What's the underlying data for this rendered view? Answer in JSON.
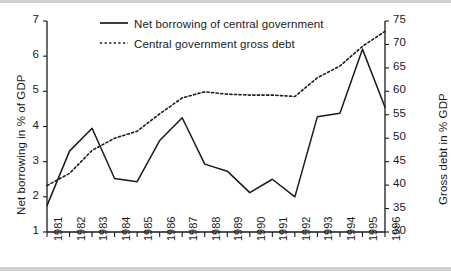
{
  "chart_data": {
    "type": "line",
    "title": "",
    "xlabel": "",
    "ylabel": "Net borrowing in % of GDP",
    "y2label": "Gross debt in % GDP",
    "grid": false,
    "legend_position": "top-center",
    "x": [
      1981,
      1982,
      1983,
      1984,
      1985,
      1986,
      1987,
      1988,
      1989,
      1990,
      1991,
      1992,
      1993,
      1994,
      1995,
      1996
    ],
    "categories": [
      "1981",
      "1982",
      "1983",
      "1984",
      "1985",
      "1986",
      "1987",
      "1988",
      "1989",
      "1990",
      "1991",
      "1992",
      "1993",
      "1994",
      "1995",
      "1996"
    ],
    "ylim": [
      1,
      7
    ],
    "yticks": [
      1,
      2,
      3,
      4,
      5,
      6,
      7
    ],
    "y2lim": [
      30,
      75
    ],
    "y2ticks": [
      30,
      35,
      40,
      45,
      50,
      55,
      60,
      65,
      70,
      75
    ],
    "series": [
      {
        "name": "Net borrowing of central government",
        "axis": "left",
        "style": "solid",
        "color": "#1a1a1a",
        "values": [
          1.75,
          3.3,
          3.95,
          2.52,
          2.43,
          3.6,
          4.25,
          2.93,
          2.73,
          2.12,
          2.5,
          2.0,
          4.28,
          4.38,
          6.2,
          4.55
        ]
      },
      {
        "name": "Central government gross debt",
        "axis": "right",
        "style": "dotted",
        "color": "#1a1a1a",
        "values": [
          39.9,
          42.5,
          47.4,
          50.0,
          51.5,
          55.2,
          58.6,
          59.9,
          59.4,
          59.2,
          59.2,
          58.9,
          62.9,
          65.4,
          69.6,
          72.8
        ]
      }
    ]
  },
  "legend": {
    "items": [
      {
        "label": "Net borrowing of central government",
        "style": "solid"
      },
      {
        "label": "Central government gross debt",
        "style": "dotted"
      }
    ]
  },
  "axes": {
    "left_title": "Net borrowing in % of GDP",
    "right_title": "Gross debt in % GDP",
    "y_left_ticks": [
      "7",
      "6",
      "5",
      "4",
      "3",
      "2",
      "1"
    ],
    "y_right_ticks": [
      "75",
      "70",
      "65",
      "60",
      "55",
      "50",
      "45",
      "40",
      "35",
      "30"
    ],
    "x_ticks": [
      "1981",
      "1982",
      "1983",
      "1984",
      "1985",
      "1986",
      "1987",
      "1988",
      "1989",
      "1990",
      "1991",
      "1992",
      "1993",
      "1994",
      "1995",
      "1996"
    ]
  },
  "colors": {
    "ink": "#1a1a1a",
    "background": "#ffffff",
    "scan_band": "#cfcfcf"
  }
}
